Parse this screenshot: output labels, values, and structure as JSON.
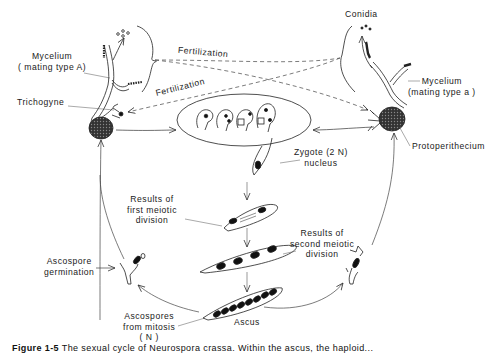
{
  "diagram": {
    "type": "life-cycle",
    "labels": {
      "mycelium_a": [
        "Mycelium",
        "( mating type A)"
      ],
      "mycelium_alpha": [
        "Mycelium",
        "(mating type a )"
      ],
      "conidia": "Conidia",
      "fertilization_top": "Fertilization",
      "fertilization_bottom": "Fertilization",
      "trichogyne": "Trichogyne",
      "protoperithecium": "Protoperithecium",
      "zygote": [
        "Zygote (2 N)",
        "nucleus"
      ],
      "first_meiotic": [
        "Results of",
        "first meiotic",
        "division"
      ],
      "second_meiotic": [
        "Results of",
        "second meiotic",
        "division"
      ],
      "ascospore_germination": [
        "Ascospore",
        "germination"
      ],
      "ascospores_mitosis": [
        "Ascospores",
        "from mitosis",
        "( N )"
      ],
      "ascus": "Ascus"
    },
    "caption": {
      "figure_label": "Figure 1-5",
      "text": "The sexual cycle of Neurospora crassa. Within the ascus, the haploid..."
    },
    "colors": {
      "ink": "#1a1a1a",
      "background": "#ffffff",
      "nucleus_fill": "#111111"
    }
  }
}
